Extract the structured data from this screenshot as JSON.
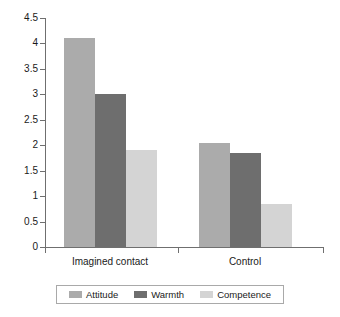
{
  "chart_data": {
    "type": "bar",
    "title": "",
    "xlabel": "",
    "ylabel": "",
    "categories": [
      "Imagined contact",
      "Control"
    ],
    "series": [
      {
        "name": "Attitude",
        "color": "#ababab",
        "values": [
          4.1,
          2.05
        ]
      },
      {
        "name": "Warmth",
        "color": "#6e6e6e",
        "values": [
          3.0,
          1.85
        ]
      },
      {
        "name": "Competence",
        "color": "#d4d4d4",
        "values": [
          1.9,
          0.85
        ]
      }
    ],
    "ylim": [
      0,
      4.5
    ],
    "ytick_step": 0.5,
    "ytick_labels": [
      "0",
      "0.5",
      "1",
      "1.5",
      "2",
      "2.5",
      "3",
      "3.5",
      "4",
      "4.5"
    ],
    "grid": false,
    "legend_position": "bottom"
  },
  "axes": {
    "y_ticks": [
      {
        "value": 4.5,
        "label": "4.5"
      },
      {
        "value": 4,
        "label": "4"
      },
      {
        "value": 3.5,
        "label": "3.5"
      },
      {
        "value": 3,
        "label": "3"
      },
      {
        "value": 2.5,
        "label": "2.5"
      },
      {
        "value": 2,
        "label": "2"
      },
      {
        "value": 1.5,
        "label": "1.5"
      },
      {
        "value": 1,
        "label": "1"
      },
      {
        "value": 0.5,
        "label": "0.5"
      },
      {
        "value": 0,
        "label": "0"
      }
    ],
    "x_categories": [
      {
        "label": "Imagined contact"
      },
      {
        "label": "Control"
      }
    ]
  },
  "legend": {
    "items": [
      {
        "label": "Attitude",
        "color": "#ababab"
      },
      {
        "label": "Warmth",
        "color": "#6e6e6e"
      },
      {
        "label": "Competence",
        "color": "#d4d4d4"
      }
    ]
  }
}
